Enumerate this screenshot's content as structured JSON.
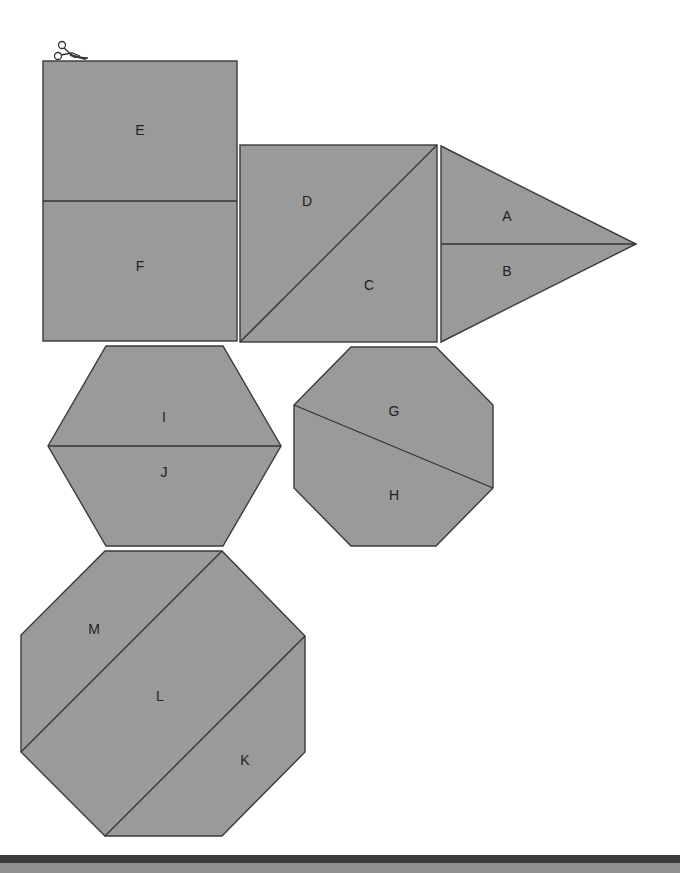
{
  "diagram": {
    "type": "cut-out pattern pieces",
    "fill_color": "#9a9a9a",
    "line_color": "#3a3a3a",
    "background": "#ffffff",
    "icon": "scissors-icon",
    "shapes": [
      {
        "shape": "rectangle",
        "pieces": [
          "E",
          "F"
        ]
      },
      {
        "shape": "square",
        "pieces": [
          "D",
          "C"
        ]
      },
      {
        "shape": "triangle",
        "pieces": [
          "A",
          "B"
        ]
      },
      {
        "shape": "hexagon",
        "pieces": [
          "I",
          "J"
        ]
      },
      {
        "shape": "small-octagon",
        "pieces": [
          "G",
          "H"
        ]
      },
      {
        "shape": "large-octagon",
        "pieces": [
          "M",
          "L",
          "K"
        ]
      }
    ]
  },
  "labels": {
    "A": "A",
    "B": "B",
    "C": "C",
    "D": "D",
    "E": "E",
    "F": "F",
    "G": "G",
    "H": "H",
    "I": "I",
    "J": "J",
    "K": "K",
    "L": "L",
    "M": "M"
  },
  "footer": {
    "dark_band_color": "#3a3a3a",
    "gray_band_color": "#8f8f8f"
  }
}
